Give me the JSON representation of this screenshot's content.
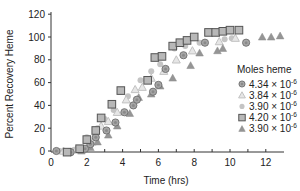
{
  "chart_data": {
    "type": "scatter",
    "title": "",
    "xlabel": "Time (hrs)",
    "ylabel": "Percent Recovery Heme",
    "xlim": [
      0,
      13
    ],
    "ylim": [
      0,
      120
    ],
    "xticks": [
      0,
      2,
      4,
      6,
      8,
      10,
      12
    ],
    "yticks": [
      0,
      20,
      40,
      60,
      80,
      100,
      120
    ],
    "grid": false,
    "legend": {
      "title": "Moles heme",
      "position": "right-middle"
    },
    "series": [
      {
        "name": "4.34 × 10-6",
        "marker": "circle-dot",
        "color": "#9a9a9a",
        "x": [
          0.3,
          1.1,
          1.9,
          2.2,
          2.5,
          3.1,
          3.6,
          4.1,
          4.6,
          4.8,
          5.7,
          6.0,
          6.4,
          7.4,
          8.6,
          10.9
        ],
        "y": [
          0,
          -1,
          2,
          6,
          12,
          18,
          25,
          34,
          40,
          45,
          52,
          58,
          72,
          84,
          95,
          95
        ]
      },
      {
        "name": "3.84 × 10-6",
        "marker": "triangle-open",
        "color": "#c8c8c8",
        "x": [
          0.7,
          1.4,
          2.3,
          2.8,
          3.2,
          3.7,
          4.2,
          4.7,
          5.1,
          5.6,
          6.3,
          7.0,
          7.9,
          9.4,
          10.3
        ],
        "y": [
          0,
          1,
          8,
          22,
          26,
          34,
          45,
          54,
          56,
          64,
          70,
          80,
          88,
          96,
          99
        ]
      },
      {
        "name": "3.90 × 10-6",
        "marker": "dot",
        "color": "#c0c0c0",
        "x": [
          0.5,
          1.3,
          2.0,
          2.6,
          3.0,
          3.5,
          4.3,
          5.0,
          5.6,
          6.1,
          6.9,
          7.5,
          8.3,
          9.7,
          10.1
        ],
        "y": [
          0,
          1,
          12,
          20,
          28,
          36,
          48,
          62,
          70,
          76,
          90,
          92,
          95,
          98,
          99
        ]
      },
      {
        "name": "4.20 × 10-6",
        "marker": "square",
        "color": "#a8a8a8",
        "x": [
          0.9,
          1.6,
          2.0,
          2.5,
          2.8,
          3.4,
          3.9,
          5.4,
          5.8,
          6.2,
          6.8,
          7.2,
          7.6,
          8.0,
          8.8,
          9.2,
          9.6,
          10.0,
          10.5
        ],
        "y": [
          -1,
          2,
          10,
          18,
          29,
          41,
          53,
          62,
          82,
          83,
          92,
          95,
          97,
          100,
          104,
          104,
          105,
          106,
          106
        ]
      },
      {
        "name": "3.90 × 10-6",
        "marker": "triangle-filled",
        "color": "#9a9a9a",
        "x": [
          1.0,
          1.7,
          2.2,
          2.6,
          3.2,
          3.7,
          4.4,
          4.9,
          5.6,
          6.1,
          6.8,
          7.8,
          8.3,
          9.3,
          9.6,
          11.8,
          12.3,
          12.8
        ],
        "y": [
          -1,
          0,
          3,
          8,
          14,
          22,
          33,
          47,
          50,
          57,
          64,
          75,
          86,
          88,
          90,
          100,
          100,
          101
        ]
      }
    ]
  },
  "axes": {
    "xlabel": "Time (hrs)",
    "ylabel": "Percent Recovery Heme",
    "xtick_labels": [
      "0",
      "2",
      "4",
      "6",
      "8",
      "10",
      "12"
    ],
    "ytick_labels": [
      "0",
      "20",
      "40",
      "60",
      "80",
      "100",
      "120"
    ]
  },
  "legend": {
    "title": "Moles heme",
    "entries": [
      {
        "mantissa": "4.34 × 10",
        "exp": "-6",
        "marker": "circle-dot"
      },
      {
        "mantissa": "3.84 × 10",
        "exp": "-6",
        "marker": "triangle-open"
      },
      {
        "mantissa": "3.90 × 10",
        "exp": "-6",
        "marker": "dot"
      },
      {
        "mantissa": "4.20 × 10",
        "exp": "-6",
        "marker": "square"
      },
      {
        "mantissa": "3.90 × 10",
        "exp": "-6",
        "marker": "triangle-filled"
      }
    ]
  }
}
